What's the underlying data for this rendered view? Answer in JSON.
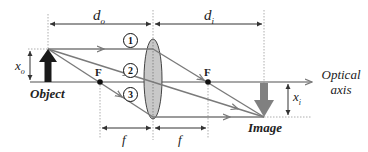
{
  "diagram": {
    "type": "thin-lens ray diagram",
    "labels": {
      "object_distance": "d",
      "object_distance_sub": "o",
      "image_distance": "d",
      "image_distance_sub": "i",
      "object_height": "x",
      "object_height_sub": "o",
      "image_height": "x",
      "image_height_sub": "i",
      "focal_left": "F",
      "focal_right": "F",
      "focal_length_left": "f",
      "focal_length_right": "f",
      "object": "Object",
      "image": "Image",
      "optical_axis_line1": "Optical",
      "optical_axis_line2": "axis"
    },
    "rays": [
      {
        "id": "1",
        "label": "1",
        "description": "parallel to axis, refracts through right focal point"
      },
      {
        "id": "2",
        "label": "2",
        "description": "through lens center, undeviated"
      },
      {
        "id": "3",
        "label": "3",
        "description": "through left focal point, exits parallel to axis"
      }
    ],
    "colors": {
      "ray": "#7a7a7a",
      "object_arrow": "#1a1a1a",
      "image_arrow": "#808080",
      "lens_fill": "#c8c8c8",
      "lens_stroke": "#444444",
      "dimension_line": "#333333",
      "axis": "#8a8a8a"
    }
  }
}
